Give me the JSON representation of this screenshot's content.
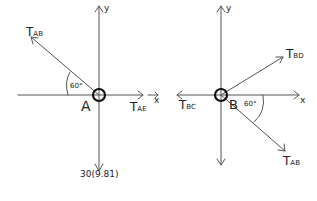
{
  "diagram": {
    "stroke_color": "#444444",
    "joint_A": {
      "label": "A",
      "axes": {
        "x_label": "x",
        "y_label": "y"
      },
      "forces": [
        {
          "name": "T",
          "sub": "AB",
          "direction": "up-left",
          "angle_deg": 60,
          "angle_label": "60°"
        },
        {
          "name": "T",
          "sub": "AE",
          "direction": "right"
        },
        {
          "name": "weight",
          "label": "30(9.81)",
          "direction": "down"
        }
      ]
    },
    "joint_B": {
      "label": "B",
      "axes": {
        "x_label": "x",
        "y_label": "y"
      },
      "forces": [
        {
          "name": "T",
          "sub": "BD",
          "direction": "up-right"
        },
        {
          "name": "T",
          "sub": "BC",
          "direction": "left"
        },
        {
          "name": "T",
          "sub": "AB",
          "direction": "down-right",
          "angle_deg": 60,
          "angle_label": "60°"
        }
      ]
    }
  }
}
